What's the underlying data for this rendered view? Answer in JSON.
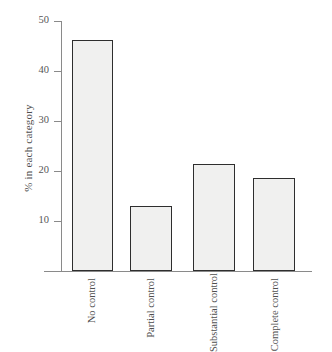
{
  "chart_data": {
    "type": "bar",
    "title": "",
    "xlabel": "",
    "ylabel": "% in each category",
    "categories": [
      "No control",
      "Partial control",
      "Substantial control",
      "Complete control"
    ],
    "category_lines": [
      [
        "No",
        "control"
      ],
      [
        "Partial",
        "control"
      ],
      [
        "Substantial",
        "control"
      ],
      [
        "Complete",
        "control"
      ]
    ],
    "values": [
      46.2,
      13.0,
      21.5,
      18.7
    ],
    "ylim": [
      0,
      50
    ],
    "yticks": [
      10,
      20,
      30,
      40,
      50
    ],
    "ytick_labels": [
      "10",
      "20",
      "30",
      "40",
      "50"
    ],
    "grid": false,
    "legend": false,
    "bar_fill_color": "#f0f0ef",
    "bar_edge_color": "#2e2e2e",
    "axis_color": "#8a8a8a",
    "text_color": "#4f4f4f",
    "background_color": "#ffffff"
  },
  "axis": {
    "y_title": "% in each category"
  },
  "ticks": {
    "t50": "50",
    "t40": "40",
    "t30": "30",
    "t20": "20",
    "t10": "10"
  },
  "categories": {
    "c0_line1": "No",
    "c0_line2": "control",
    "c1_line1": "Partial",
    "c1_line2": "control",
    "c2_line1": "Substantial",
    "c2_line2": "control",
    "c3_line1": "Complete",
    "c3_line2": "control"
  }
}
